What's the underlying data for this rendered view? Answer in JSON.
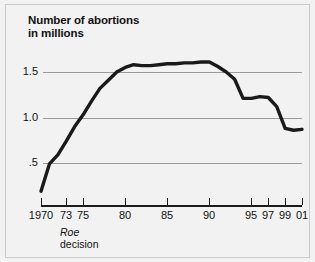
{
  "figure": {
    "background_color": "#f2f2f2",
    "border_color": "#c9c9c9",
    "line_color": "#1a1a1a",
    "grid_color": "#9a9a9a",
    "text_color": "#111111"
  },
  "title": {
    "line1": "Number of abortions",
    "line2": "in millions"
  },
  "annotation": {
    "label_italic": "Roe",
    "label_plain": "decision"
  },
  "chart_data": {
    "type": "line",
    "title": "Number of abortions in millions",
    "subtitle": "",
    "xlabel": "",
    "ylabel": "Number of abortions in millions",
    "xlim": [
      1970,
      2001
    ],
    "ylim": [
      0,
      1.75
    ],
    "grid": true,
    "grid_axis": "y",
    "legend": false,
    "legend_position": "none",
    "ytick_labels": [
      "1.5",
      "1.0",
      ".5"
    ],
    "ytick_values": [
      1.5,
      1.0,
      0.5
    ],
    "xtick_labels": [
      "1970",
      "73",
      "75",
      "80",
      "85",
      "90",
      "95",
      "97",
      "99",
      "01"
    ],
    "xtick_values": [
      1970,
      1973,
      1975,
      1980,
      1985,
      1990,
      1995,
      1997,
      1999,
      2001
    ],
    "annotations": [
      {
        "text": "Roe decision",
        "x": 1973,
        "style": "italic-first-word"
      }
    ],
    "x": [
      1970,
      1971,
      1972,
      1973,
      1974,
      1975,
      1976,
      1977,
      1978,
      1979,
      1980,
      1981,
      1982,
      1983,
      1984,
      1985,
      1986,
      1987,
      1988,
      1989,
      1990,
      1991,
      1992,
      1993,
      1994,
      1995,
      1996,
      1997,
      1998,
      1999,
      2000,
      2001
    ],
    "values": [
      0.19,
      0.49,
      0.59,
      0.74,
      0.9,
      1.03,
      1.18,
      1.32,
      1.41,
      1.5,
      1.55,
      1.58,
      1.57,
      1.57,
      1.58,
      1.59,
      1.59,
      1.6,
      1.6,
      1.61,
      1.61,
      1.56,
      1.5,
      1.42,
      1.21,
      1.21,
      1.23,
      1.22,
      1.12,
      0.88,
      0.86,
      0.87
    ],
    "series": [
      {
        "name": "Number of abortions in millions",
        "color": "#1a1a1a",
        "values": [
          0.19,
          0.49,
          0.59,
          0.74,
          0.9,
          1.03,
          1.18,
          1.32,
          1.41,
          1.5,
          1.55,
          1.58,
          1.57,
          1.57,
          1.58,
          1.59,
          1.59,
          1.6,
          1.6,
          1.61,
          1.61,
          1.56,
          1.5,
          1.42,
          1.21,
          1.21,
          1.23,
          1.22,
          1.12,
          0.88,
          0.86,
          0.87
        ]
      }
    ]
  }
}
